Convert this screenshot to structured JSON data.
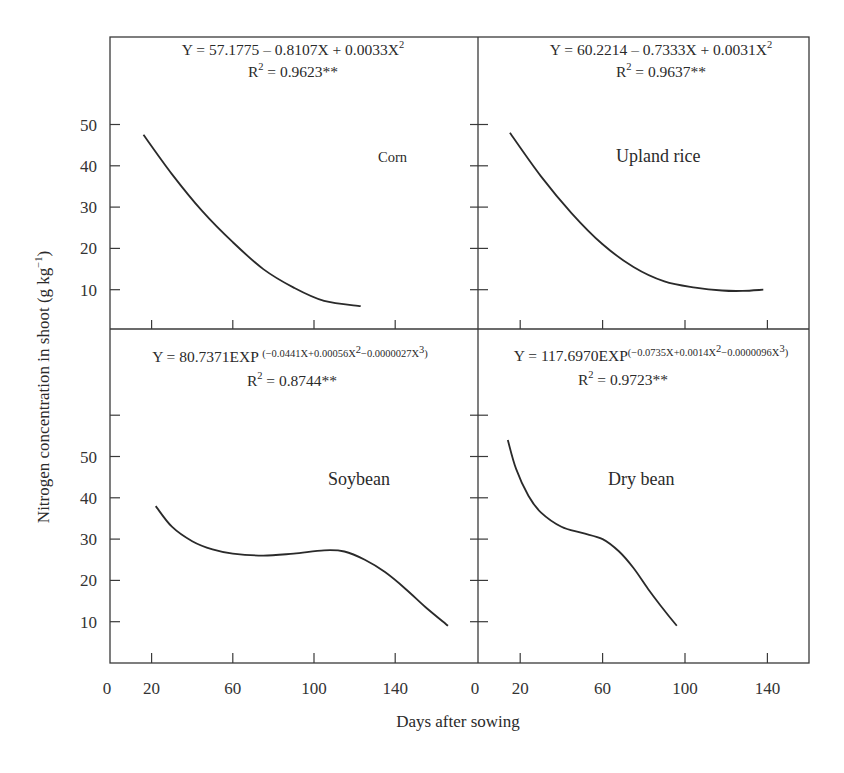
{
  "chart_data": {
    "type": "line",
    "xlabel": "Days after sowing",
    "ylabel": "Nitrogen concentration in shoot (g kg",
    "ylabel_sup": "−1",
    "ylabel_close": ")",
    "xticks": [
      0,
      20,
      60,
      100,
      140
    ],
    "yticks": [
      10,
      20,
      30,
      40,
      50
    ],
    "xlim": [
      0,
      160
    ],
    "ylim": [
      0,
      70
    ],
    "grid": false,
    "panels": [
      {
        "name": "Corn",
        "equation": {
          "main": "Y = 57.1775 – 0.8107X + 0.0033X",
          "sup": "2",
          "tail": ""
        },
        "r2": {
          "prefix": "R",
          "sup": "2",
          "value": " = 0.9623**"
        },
        "points": [
          [
            16,
            47.5
          ],
          [
            30,
            38
          ],
          [
            45,
            29
          ],
          [
            60,
            21.5
          ],
          [
            75,
            15
          ],
          [
            90,
            10.5
          ],
          [
            105,
            7.3
          ],
          [
            123,
            6
          ]
        ]
      },
      {
        "name": "Upland rice",
        "equation": {
          "main": "Y = 60.2214 – 0.7333X + 0.0031X",
          "sup": "2",
          "tail": ""
        },
        "r2": {
          "prefix": "R",
          "sup": "2",
          "value": "  = 0.9637**"
        },
        "points": [
          [
            15,
            48
          ],
          [
            30,
            37.5
          ],
          [
            45,
            28.5
          ],
          [
            60,
            21
          ],
          [
            75,
            15.5
          ],
          [
            90,
            12
          ],
          [
            105,
            10.5
          ],
          [
            118,
            9.8
          ],
          [
            128,
            9.7
          ],
          [
            138,
            10
          ]
        ]
      },
      {
        "name": "Soybean",
        "equation": {
          "main": "Y = 80.7371EXP ",
          "exp": "(−0.0441X+0.00056X",
          "exp_sup1": "2",
          "exp_mid": "−0.0000027X",
          "exp_sup2": "3",
          "exp_end": ")"
        },
        "r2": {
          "prefix": "R",
          "sup": "2",
          "value": " = 0.8744**"
        },
        "points": [
          [
            22,
            38
          ],
          [
            30,
            33
          ],
          [
            40,
            29.5
          ],
          [
            50,
            27.5
          ],
          [
            60,
            26.5
          ],
          [
            75,
            26
          ],
          [
            90,
            26.5
          ],
          [
            105,
            27.3
          ],
          [
            115,
            27
          ],
          [
            125,
            25
          ],
          [
            135,
            22
          ],
          [
            145,
            18
          ],
          [
            155,
            13.5
          ],
          [
            166,
            9
          ]
        ]
      },
      {
        "name": "Dry bean",
        "equation": {
          "main": "Y = 117.6970EXP",
          "exp": "(−0.0735X+0.0014X",
          "exp_sup1": "2",
          "exp_mid": "−0.0000096X",
          "exp_sup2": "3",
          "exp_end": ")"
        },
        "r2": {
          "prefix": "R",
          "sup": "2",
          "value": " = 0.9723**"
        },
        "points": [
          [
            14,
            54
          ],
          [
            18,
            47
          ],
          [
            24,
            40.5
          ],
          [
            30,
            36.5
          ],
          [
            40,
            33
          ],
          [
            50,
            31.5
          ],
          [
            60,
            30
          ],
          [
            68,
            27
          ],
          [
            75,
            23
          ],
          [
            82,
            18
          ],
          [
            88,
            14
          ],
          [
            96,
            9
          ]
        ]
      }
    ]
  }
}
